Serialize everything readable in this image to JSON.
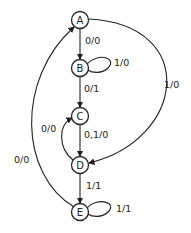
{
  "diagram": {
    "type": "state-machine",
    "states": [
      {
        "id": "A",
        "label": "A"
      },
      {
        "id": "B",
        "label": "B"
      },
      {
        "id": "C",
        "label": "C"
      },
      {
        "id": "D",
        "label": "D"
      },
      {
        "id": "E",
        "label": "E"
      }
    ],
    "transitions": [
      {
        "from": "A",
        "to": "B",
        "label": "0/0"
      },
      {
        "from": "B",
        "to": "B",
        "label": "1/0"
      },
      {
        "from": "B",
        "to": "C",
        "label": "0/1"
      },
      {
        "from": "A",
        "to": "D",
        "label": "1/0"
      },
      {
        "from": "C",
        "to": "D",
        "label": "0,1/0"
      },
      {
        "from": "D",
        "to": "C",
        "label": "0/0"
      },
      {
        "from": "D",
        "to": "E",
        "label": "1/1"
      },
      {
        "from": "E",
        "to": "E",
        "label": "1/1"
      },
      {
        "from": "E",
        "to": "A",
        "label": "0/0"
      }
    ]
  }
}
